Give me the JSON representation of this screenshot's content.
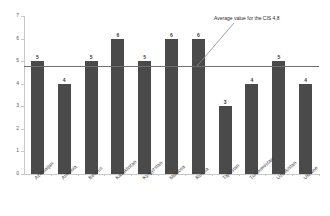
{
  "chart_data": {
    "type": "bar",
    "title": "",
    "subtitle": "",
    "xlabel": "",
    "ylabel": "",
    "ylim": [
      0,
      7
    ],
    "yticks": [
      0,
      1,
      2,
      3,
      4,
      5,
      6,
      7
    ],
    "ytick_labels": [
      "0",
      "1",
      "2",
      "3",
      "4",
      "5",
      "6",
      "7"
    ],
    "grid": false,
    "legend": "none",
    "categories": [
      "Azerbaijan",
      "Armenia",
      "Belarus",
      "Kazakhstan",
      "Kyrgyzstan",
      "Moldova",
      "Russia",
      "Tajikistan",
      "Turkmenistan",
      "Uzbekistan",
      "Ukraine"
    ],
    "values": [
      5,
      4,
      5,
      6,
      5,
      6,
      6,
      3,
      4,
      5,
      4
    ],
    "data_labels": [
      "5",
      "4",
      "5",
      "6",
      "5",
      "6",
      "6",
      "3",
      "4",
      "5",
      "4"
    ],
    "reference_line": {
      "value": 4.8,
      "label": "Average value for the CIS 4,8",
      "color": "#707070"
    },
    "annotations": [
      {
        "text": "Average value for the CIS 4,8",
        "has_leader_line": true
      }
    ],
    "colors": {
      "bar": "#4a4a4a",
      "axis": "#c9c9c9",
      "text": "#3a3a3a",
      "reference_line": "#707070",
      "background": "#ffffff"
    }
  }
}
